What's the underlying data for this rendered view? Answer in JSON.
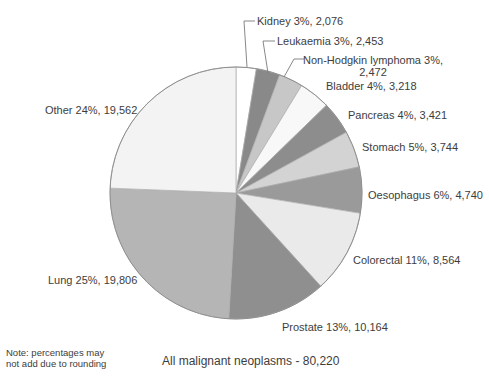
{
  "chart_data": {
    "type": "pie",
    "title": "",
    "total": 80220,
    "total_label": "All malignant neoplasms - 80,220",
    "note_lines": [
      "Note: percentages may",
      "not add due to rounding"
    ],
    "legend_position": "labels-around-pie",
    "start_angle_deg": 0,
    "direction": "clockwise",
    "slices": [
      {
        "id": "kidney",
        "name": "Kidney",
        "percent": 3,
        "value": 2076,
        "label": "Kidney 3%, 2,076",
        "color": "#ffffff"
      },
      {
        "id": "leukaemia",
        "name": "Leukaemia",
        "percent": 3,
        "value": 2453,
        "label": "Leukaemia 3%, 2,453",
        "color": "#898989"
      },
      {
        "id": "nhl",
        "name": "Non-Hodgkin lymphoma",
        "percent": 3,
        "value": 2472,
        "label": "Non-Hodgkin lymphoma 3%, 2,472",
        "label_line1": "Non-Hodgkin lymphoma 3%,",
        "label_line2": "2,472",
        "color": "#c7c7c7"
      },
      {
        "id": "bladder",
        "name": "Bladder",
        "percent": 4,
        "value": 3218,
        "label": "Bladder 4%, 3,218",
        "color": "#f8f8f8"
      },
      {
        "id": "pancreas",
        "name": "Pancreas",
        "percent": 4,
        "value": 3421,
        "label": "Pancreas 4%, 3,421",
        "color": "#8d8d8d"
      },
      {
        "id": "stomach",
        "name": "Stomach",
        "percent": 5,
        "value": 3744,
        "label": "Stomach 5%, 3,744",
        "color": "#d3d3d3"
      },
      {
        "id": "oesophagus",
        "name": "Oesophagus",
        "percent": 6,
        "value": 4740,
        "label": "Oesophagus 6%, 4,740",
        "color": "#9a9a9a"
      },
      {
        "id": "colorectal",
        "name": "Colorectal",
        "percent": 11,
        "value": 8564,
        "label": "Colorectal 11%, 8,564",
        "color": "#eaeaea"
      },
      {
        "id": "prostate",
        "name": "Prostate",
        "percent": 13,
        "value": 10164,
        "label": "Prostate 13%, 10,164",
        "color": "#8f8f8f"
      },
      {
        "id": "lung",
        "name": "Lung",
        "percent": 25,
        "value": 19806,
        "label": "Lung 25%, 19,806",
        "color": "#b5b5b5"
      },
      {
        "id": "other",
        "name": "Other",
        "percent": 24,
        "value": 19562,
        "label": "Other 24%, 19,562",
        "color": "#f3f3f3"
      }
    ],
    "colors": {
      "slice_border": "#adadad",
      "outer_rim": "#8f8f8f",
      "leader_line": "#7a7a7a",
      "text": "#3d3d3d"
    }
  }
}
